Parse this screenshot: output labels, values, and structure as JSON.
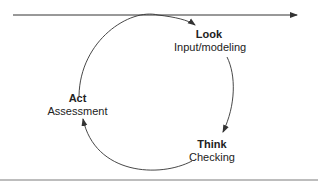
{
  "diagram": {
    "type": "cycle",
    "timeline_arrow": {
      "direction": "right"
    },
    "nodes": [
      {
        "id": "look",
        "title": "Look",
        "subtitle": "Input/modeling"
      },
      {
        "id": "think",
        "title": "Think",
        "subtitle": "Checking"
      },
      {
        "id": "act",
        "title": "Act",
        "subtitle": "Assessment"
      }
    ],
    "edges": [
      {
        "from": "act",
        "to": "look"
      },
      {
        "from": "look",
        "to": "think"
      },
      {
        "from": "think",
        "to": "act"
      }
    ],
    "colors": {
      "line": "#333333",
      "rule": "#bdbdbd"
    }
  }
}
